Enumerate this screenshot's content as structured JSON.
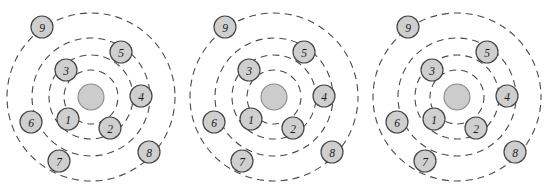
{
  "figure": {
    "canvas": {
      "width": 549,
      "height": 190,
      "background": "#ffffff"
    },
    "style": {
      "ring_stroke": "#4a4a4a",
      "ring_dash": "7 5",
      "node_fill": "#cfcfcf",
      "node_stroke": "#454545",
      "hub_fill": "#cccccc",
      "hub_stroke": "#8a8a8a",
      "label_color": "#1a1a1a"
    },
    "panel_count": 3,
    "panel_offset_x": 183,
    "rings": {
      "count": 4,
      "radii": [
        27,
        42,
        59,
        84
      ],
      "labels": [
        "ring-1",
        "ring-2",
        "ring-3",
        "ring-4"
      ]
    },
    "hub": {
      "label": "",
      "radius": 13,
      "center": {
        "x": 91,
        "y": 97
      }
    },
    "node_radius": 11,
    "nodes": [
      {
        "id": "node-1",
        "label": "1",
        "x": 68,
        "y": 119,
        "ring": 1
      },
      {
        "id": "node-2",
        "label": "2",
        "x": 110,
        "y": 128,
        "ring": 1
      },
      {
        "id": "node-3",
        "label": "3",
        "x": 66,
        "y": 70,
        "ring": 2
      },
      {
        "id": "node-4",
        "label": "4",
        "x": 141,
        "y": 96,
        "ring": 2
      },
      {
        "id": "node-5",
        "label": "5",
        "x": 121,
        "y": 52,
        "ring": 3
      },
      {
        "id": "node-6",
        "label": "6",
        "x": 31,
        "y": 122,
        "ring": 3
      },
      {
        "id": "node-7",
        "label": "7",
        "x": 59,
        "y": 161,
        "ring": 4
      },
      {
        "id": "node-8",
        "label": "8",
        "x": 149,
        "y": 152,
        "ring": 4
      },
      {
        "id": "node-9",
        "label": "9",
        "x": 42,
        "y": 27,
        "ring": 4
      }
    ],
    "panels": [
      {
        "id": "panel-1",
        "name": "left-panel",
        "offset_x": 0
      },
      {
        "id": "panel-2",
        "name": "middle-panel",
        "offset_x": 183
      },
      {
        "id": "panel-3",
        "name": "right-panel",
        "offset_x": 366
      }
    ]
  }
}
